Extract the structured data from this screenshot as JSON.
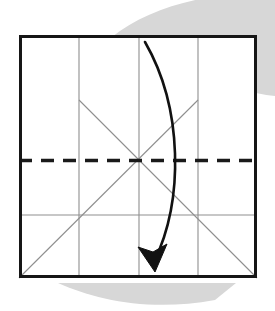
{
  "figure": {
    "title": "Origami crease pattern with valley fold and folding arrow",
    "caption": "",
    "step_number": "",
    "background_color": "#ffffff",
    "canvas": {
      "width": 275,
      "height": 311
    }
  },
  "colors": {
    "paper_edge": "#161616",
    "crease_line": "#8f8f8f",
    "valley_fold_dash": "#1a1a1a",
    "arrow": "#111111",
    "shadow": "#d7d7d7",
    "paper_fill": "#ffffff"
  },
  "paper": {
    "label": "square sheet",
    "x": 19,
    "y": 35,
    "width": 238,
    "height": 243,
    "edge_width": 3
  },
  "shadow_blobs": [
    {
      "name": "top-right-shadow",
      "path": "M 112 37 C 150 6 215 -10 275 -6 L 275 96 C 230 92 170 62 112 37 Z"
    },
    {
      "name": "bottom-left-shadow",
      "path": "M 58 283 C 96 300 150 312 215 300 L 236 283 L 70 283 Z"
    }
  ],
  "crease_lines": {
    "vertical": [
      {
        "name": "vertical-crease-quarter-left",
        "x": 79,
        "y1": 35,
        "y2": 278
      },
      {
        "name": "vertical-crease-center",
        "x": 139,
        "y1": 35,
        "y2": 278
      },
      {
        "name": "vertical-crease-quarter-right",
        "x": 198,
        "y1": 35,
        "y2": 278
      }
    ],
    "horizontal": [
      {
        "name": "horizontal-crease-lower",
        "y": 215,
        "x1": 19,
        "x2": 257
      }
    ],
    "diagonal": [
      {
        "name": "diagonal-rising-left-to-right",
        "x1": 19,
        "y1": 278,
        "x2": 198,
        "y2": 100
      },
      {
        "name": "diagonal-falling-left-to-right",
        "x1": 79,
        "y1": 100,
        "x2": 257,
        "y2": 278
      }
    ]
  },
  "valley_fold": {
    "name": "valley-fold-dashed-line",
    "type": "dashed",
    "y": 160,
    "x1": 19,
    "x2": 257,
    "stroke_width": 3.4,
    "dash_pattern": "13 9"
  },
  "fold_arrow": {
    "name": "fold-direction-arrow",
    "description": "curved arrow from top edge down to bottom edge",
    "start": {
      "x": 145,
      "y": 42
    },
    "end": {
      "x": 153,
      "y": 266
    },
    "control_1": {
      "x": 186,
      "y": 115
    },
    "control_2": {
      "x": 182,
      "y": 205
    },
    "path": "M 145 42 C 183 108 184 200 154 262",
    "stroke_width": 2.6,
    "head_path": "M 138 247 L 155 272 L 167 244 L 153 252 Z"
  }
}
